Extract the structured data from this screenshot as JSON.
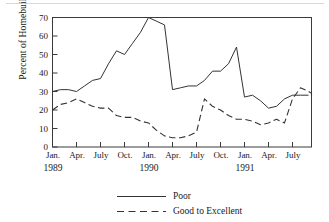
{
  "chart_data": {
    "type": "line",
    "title": "",
    "subtitle": "",
    "xlabel": "",
    "ylabel": "Percent of Homebuilders",
    "ylim": [
      0,
      70
    ],
    "yticks": [
      0,
      10,
      20,
      30,
      40,
      50,
      60,
      70
    ],
    "ytick_labels": [
      "0",
      "10",
      "20",
      "30",
      "40",
      "50",
      "60",
      "70"
    ],
    "grid": false,
    "legend_position": "bottom-center",
    "x_axis": {
      "tick_labels": [
        "Jan.",
        "Apr.",
        "July",
        "Oct.",
        "Jan.",
        "Apr.",
        "July",
        "Oct.",
        "Jan.",
        "Apr.",
        "July"
      ],
      "year_labels": [
        "1989",
        "1990",
        "1991"
      ],
      "year_label_at_tick": [
        0,
        4,
        8
      ],
      "x_start": "1989-01",
      "x_end": "1991-09",
      "months": [
        "Jan. 1989",
        "Feb. 1989",
        "Mar. 1989",
        "Apr. 1989",
        "May 1989",
        "June 1989",
        "July 1989",
        "Aug. 1989",
        "Sep. 1989",
        "Oct. 1989",
        "Nov. 1989",
        "Dec. 1989",
        "Jan. 1990",
        "Feb. 1990",
        "Mar. 1990",
        "Apr. 1990",
        "May 1990",
        "June 1990",
        "July 1990",
        "Aug. 1990",
        "Sep. 1990",
        "Oct. 1990",
        "Nov. 1990",
        "Dec. 1990",
        "Jan. 1991",
        "Feb. 1991",
        "Mar. 1991",
        "Apr. 1991",
        "May 1991",
        "June 1991",
        "July 1991",
        "Aug. 1991",
        "Sep. 1991"
      ]
    },
    "series": [
      {
        "name": "Poor",
        "style": "solid",
        "color": "#333333",
        "values": [
          30,
          31,
          31,
          30,
          33,
          36,
          37,
          45,
          52,
          50,
          56,
          62,
          70,
          68,
          66,
          31,
          32,
          33,
          33,
          36,
          41,
          41,
          45,
          54,
          27,
          28,
          25,
          21,
          22,
          26,
          28,
          28,
          28
        ]
      },
      {
        "name": "Good to Excellent",
        "style": "dashed",
        "color": "#333333",
        "values": [
          20,
          23,
          24,
          26,
          24,
          22,
          21,
          21,
          17,
          16,
          16,
          14,
          13,
          9,
          6,
          5,
          5,
          6,
          8,
          26,
          22,
          20,
          17,
          15,
          15,
          14,
          12,
          13,
          15,
          13,
          26,
          32,
          30,
          29,
          27,
          26
        ]
      }
    ],
    "legend": [
      {
        "label": "Poor",
        "style": "solid"
      },
      {
        "label": "Good to Excellent",
        "style": "dashed"
      }
    ]
  },
  "axis": {
    "y_title": "Percent of Homebuilders"
  }
}
